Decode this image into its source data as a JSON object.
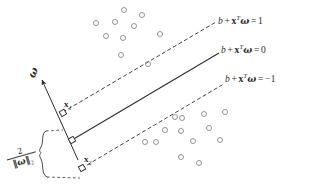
{
  "figure": {
    "background_color": "#ffffff",
    "ink_color": "#2b2b2b",
    "point_color": "#888888"
  },
  "labels": {
    "upper_margin": {
      "b": "b",
      "plus": "+",
      "x": "x",
      "transpose": "T",
      "omega": "ω",
      "equals": "=",
      "value": "1",
      "full_text": "b + xᵀω = 1"
    },
    "hyperplane": {
      "b": "b",
      "plus": "+",
      "x": "x",
      "transpose": "T",
      "omega": "ω",
      "equals": "=",
      "value": "0",
      "full_text": "b + xᵀω = 0"
    },
    "lower_margin": {
      "b": "b",
      "plus": "+",
      "x": "x",
      "transpose": "T",
      "omega": "ω",
      "equals": "=",
      "value": "−1",
      "full_text": "b + xᵀω = −1"
    },
    "normal_vector": "ω",
    "support_point_1": {
      "base": "x",
      "sub": "1"
    },
    "support_point_2": {
      "base": "x",
      "sub": "2"
    },
    "margin_width": {
      "numerator": "2",
      "denominator_norm": "‖ω‖",
      "denominator_sub": "2",
      "full_text": "2 / ‖ω‖₂"
    }
  },
  "geometry": {
    "upper_margin_line": {
      "x1": 63,
      "y1": 112,
      "x2": 216,
      "y2": 22,
      "style": "dashed"
    },
    "hyperplane_line": {
      "x1": 72,
      "y1": 140,
      "x2": 219,
      "y2": 53,
      "style": "solid"
    },
    "lower_margin_line": {
      "x1": 82,
      "y1": 168,
      "x2": 222,
      "y2": 85,
      "style": "dashed"
    },
    "normal_arrow": {
      "x1": 78,
      "y1": 160,
      "x2": 40,
      "y2": 76
    },
    "brace": {
      "x1": 44,
      "y1": 131,
      "x2": 62,
      "y2": 180
    },
    "marker_x1": {
      "x": 63,
      "y": 113
    },
    "marker_center": {
      "x": 72,
      "y": 140
    },
    "marker_x2": {
      "x": 82,
      "y": 168
    }
  },
  "chart_data": {
    "type": "scatter",
    "xlabel": "",
    "ylabel": "",
    "grid": false,
    "legend": null,
    "series": [
      {
        "name": "class-positive-cluster",
        "marker": "open-circle",
        "points": [
          [
            124,
            10
          ],
          [
            142,
            15
          ],
          [
            96,
            23
          ],
          [
            115,
            22
          ],
          [
            134,
            26
          ],
          [
            106,
            36
          ],
          [
            123,
            38
          ],
          [
            160,
            34
          ],
          [
            121,
            55
          ]
        ]
      },
      {
        "name": "class-negative-cluster",
        "marker": "open-circle",
        "points": [
          [
            175,
            117
          ],
          [
            204,
            114
          ],
          [
            225,
            112
          ],
          [
            165,
            130
          ],
          [
            181,
            131
          ],
          [
            209,
            128
          ],
          [
            145,
            142
          ],
          [
            156,
            142
          ],
          [
            193,
            141
          ],
          [
            220,
            140
          ],
          [
            181,
            157
          ],
          [
            199,
            163
          ]
        ]
      },
      {
        "name": "support-vectors-on-margins",
        "marker": "open-circle",
        "points": [
          [
            148,
            64
          ],
          [
            182,
            118
          ]
        ]
      }
    ],
    "annotated_points": [
      {
        "label": "x1",
        "x": 63,
        "y": 113,
        "marker": "open-square",
        "on": "upper_margin_line"
      },
      {
        "label": "x2",
        "x": 82,
        "y": 168,
        "marker": "open-square",
        "on": "lower_margin_line"
      },
      {
        "label": "",
        "x": 72,
        "y": 140,
        "marker": "open-square",
        "on": "hyperplane_line"
      }
    ]
  }
}
